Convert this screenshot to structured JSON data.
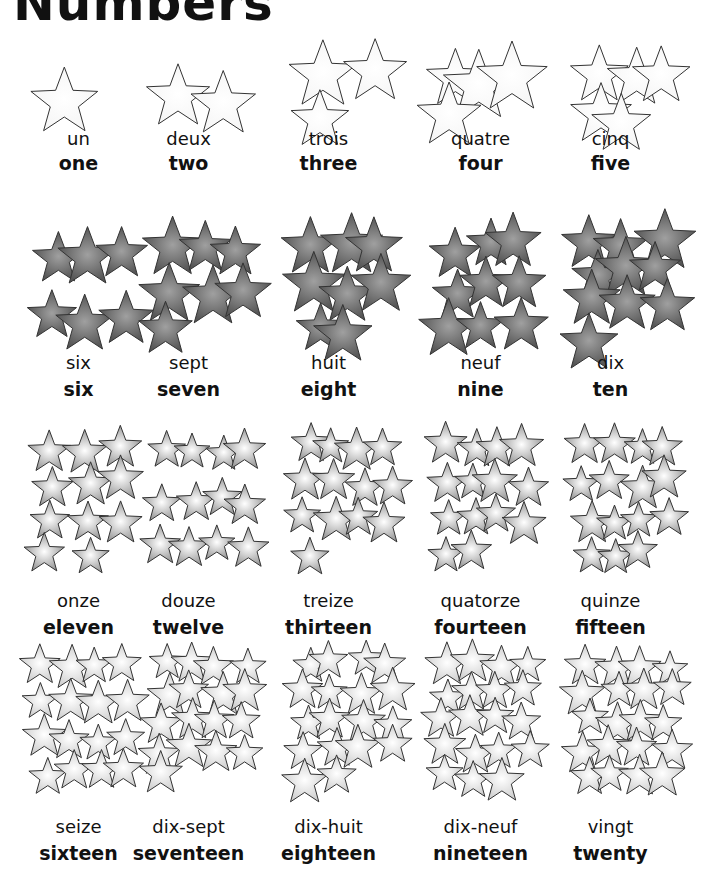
{
  "title": "Numbers",
  "colors": {
    "row1_fill": "#f6f6f6",
    "row2_fill": "#555555",
    "row3_fill": "#9a9a9a",
    "row4_fill": "#cfcfcf",
    "outline": "#333333"
  },
  "numbers": [
    {
      "value": 1,
      "french": "un",
      "english": "one"
    },
    {
      "value": 2,
      "french": "deux",
      "english": "two"
    },
    {
      "value": 3,
      "french": "trois",
      "english": "three"
    },
    {
      "value": 4,
      "french": "quatre",
      "english": "four"
    },
    {
      "value": 5,
      "french": "cinq",
      "english": "five"
    },
    {
      "value": 6,
      "french": "six",
      "english": "six"
    },
    {
      "value": 7,
      "french": "sept",
      "english": "seven"
    },
    {
      "value": 8,
      "french": "huit",
      "english": "eight"
    },
    {
      "value": 9,
      "french": "neuf",
      "english": "nine"
    },
    {
      "value": 10,
      "french": "dix",
      "english": "ten"
    },
    {
      "value": 11,
      "french": "onze",
      "english": "eleven"
    },
    {
      "value": 12,
      "french": "douze",
      "english": "twelve"
    },
    {
      "value": 13,
      "french": "treize",
      "english": "thirteen"
    },
    {
      "value": 14,
      "french": "quatorze",
      "english": "fourteen"
    },
    {
      "value": 15,
      "french": "quinze",
      "english": "fifteen"
    },
    {
      "value": 16,
      "french": "seize",
      "english": "sixteen"
    },
    {
      "value": 17,
      "french": "dix-sept",
      "english": "seventeen"
    },
    {
      "value": 18,
      "french": "dix-huit",
      "english": "eighteen"
    },
    {
      "value": 19,
      "french": "dix-neuf",
      "english": "nineteen"
    },
    {
      "value": 20,
      "french": "vingt",
      "english": "twenty"
    }
  ]
}
